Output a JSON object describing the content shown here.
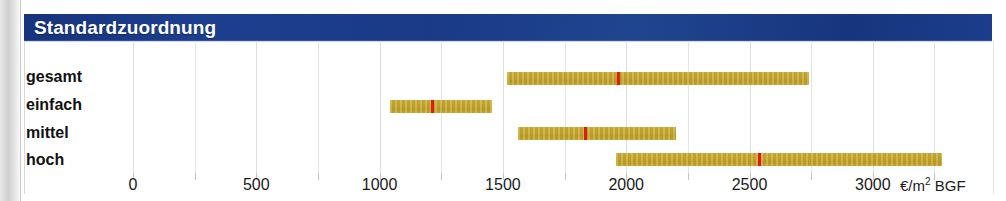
{
  "header": {
    "title": "Standardzuordnung"
  },
  "axis": {
    "unit_label": "€/m² BGF",
    "unit_currency": "€/m",
    "unit_sup": "2",
    "unit_suffix": " BGF",
    "tick_labels": [
      "0",
      "500",
      "1000",
      "1500",
      "2000",
      "2500",
      "3000"
    ]
  },
  "categories": [
    "gesamt",
    "einfach",
    "mittel",
    "hoch"
  ],
  "colors": {
    "title_bar": "#1b3a86",
    "title_text": "#ffffff",
    "bar": "#c8a92f",
    "marker": "#e11b10",
    "gridline": "#e4e4e4"
  },
  "chart_data": {
    "type": "bar",
    "subtype": "floating-range-bar-with-median-marker",
    "title": "Standardzuordnung",
    "xlabel": "€/m² BGF",
    "ylabel": "",
    "xlim": [
      0,
      3350
    ],
    "xticks": [
      0,
      500,
      1000,
      1500,
      2000,
      2500,
      3000
    ],
    "grid": true,
    "minor_grid_step": 250,
    "legend": null,
    "categories": [
      "gesamt",
      "einfach",
      "mittel",
      "hoch"
    ],
    "series": [
      {
        "name": "Spannweite",
        "type": "range",
        "low": [
          1516,
          1042,
          1561,
          1958
        ],
        "high": [
          2740,
          1456,
          2202,
          3280
        ]
      },
      {
        "name": "Median",
        "type": "marker",
        "values": [
          1965,
          1212,
          1833,
          2538
        ]
      }
    ],
    "points": [
      {
        "category": "gesamt",
        "min": 1516,
        "median": 1965,
        "max": 2740
      },
      {
        "category": "einfach",
        "min": 1042,
        "median": 1212,
        "max": 1456
      },
      {
        "category": "mittel",
        "min": 1561,
        "median": 1833,
        "max": 2202
      },
      {
        "category": "hoch",
        "min": 1958,
        "median": 2538,
        "max": 3280
      }
    ]
  },
  "layout": {
    "x_origin_px": 111,
    "px_per_unit": 0.2466,
    "rows": [
      {
        "label_top": 68,
        "bar_top": 72,
        "tick_row": 0
      },
      {
        "label_top": 96,
        "bar_top": 100,
        "tick_row": 1
      },
      {
        "label_top": 124,
        "bar_top": 127,
        "tick_row": 2
      },
      {
        "label_top": 151,
        "bar_top": 153,
        "tick_row": 3
      }
    ]
  }
}
